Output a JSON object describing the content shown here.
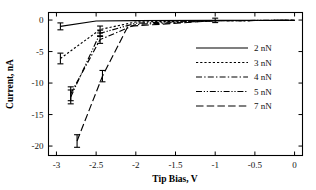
{
  "chart_data": {
    "type": "line",
    "title": "",
    "xlabel": "Tip Bias, V",
    "ylabel": "Current, nA",
    "xlim": [
      -3.1,
      0.1
    ],
    "ylim": [
      -21.5,
      1.2
    ],
    "xticks": [
      -3,
      -2.5,
      -2,
      -1.5,
      -1,
      -0.5,
      0
    ],
    "xticklabels": [
      "-3",
      "-2.5",
      "-2",
      "-1.5",
      "-1",
      "-0.5",
      "0"
    ],
    "yticks": [
      0,
      -5,
      -10,
      -15,
      -20
    ],
    "yticklabels": [
      "0",
      "-5",
      "-10",
      "-15",
      "-20"
    ],
    "grid": false,
    "legend_position": "center-right",
    "series": [
      {
        "name": "2 nN",
        "linestyle": "solid",
        "dasharray": "none",
        "x": [
          -2.95,
          -2.5,
          -2.0,
          -1.0,
          0.0
        ],
        "y": [
          -1.0,
          -0.15,
          -0.1,
          -0.05,
          -0.03
        ],
        "errors": [
          0.55,
          0.0,
          0.0,
          0.35,
          0.0
        ]
      },
      {
        "name": "3 nN",
        "linestyle": "dotted",
        "dasharray": "2.2,2.0",
        "x": [
          -2.95,
          -2.45,
          -2.0,
          -1.0,
          0.0
        ],
        "y": [
          -6.1,
          -1.5,
          -0.3,
          -0.1,
          -0.05
        ],
        "errors": [
          0.85,
          0.55,
          0.0,
          0.0,
          0.0
        ]
      },
      {
        "name": "4 nN",
        "linestyle": "dashdot",
        "dasharray": "6,2.2,1.4,2.2",
        "x": [
          -2.82,
          -2.45,
          -2.0,
          -1.0,
          0.0
        ],
        "y": [
          -11.7,
          -3.1,
          -0.7,
          -0.1,
          -0.05
        ],
        "errors": [
          1.1,
          0.6,
          0.0,
          0.0,
          0.0
        ]
      },
      {
        "name": "5 nN",
        "linestyle": "dashdotdot",
        "dasharray": "6,1.8,1.2,1.8,1.2,1.8",
        "x": [
          -2.82,
          -2.45,
          -2.0,
          -1.0,
          0.0
        ],
        "y": [
          -12.2,
          -2.1,
          -0.5,
          -0.08,
          -0.04
        ],
        "errors": [
          1.1,
          0.5,
          0.0,
          0.0,
          0.0
        ]
      },
      {
        "name": "7 nN",
        "linestyle": "longdash",
        "dasharray": "7.5,3.2",
        "x": [
          -2.74,
          -2.42,
          -2.1,
          -1.0,
          0.0
        ],
        "y": [
          -19.2,
          -8.9,
          -1.0,
          -0.1,
          -0.05
        ],
        "errors": [
          1.0,
          0.9,
          0.0,
          0.0,
          0.0
        ]
      }
    ]
  },
  "legend": {
    "entries": [
      {
        "label": "2 nN"
      },
      {
        "label": "3 nN"
      },
      {
        "label": "4 nN"
      },
      {
        "label": "5 nN"
      },
      {
        "label": "7 nN"
      }
    ]
  },
  "axes": {
    "x_title": "Tip Bias, V",
    "y_title": "Current, nA",
    "x_tick_labels": [
      "-3",
      "-2.5",
      "-2",
      "-1.5",
      "-1",
      "-0.5",
      "0"
    ],
    "y_tick_labels": [
      "0",
      "-5",
      "-10",
      "-15",
      "-20"
    ]
  }
}
